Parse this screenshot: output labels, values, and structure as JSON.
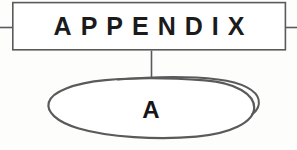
{
  "page": {
    "background_color": "#fdfdfc",
    "ink_color": "#4a4a4a",
    "text_color": "#1b1b1b",
    "width": 297,
    "height": 150
  },
  "header_box": {
    "label": "APPENDIX",
    "border_color": "#555555",
    "fill_color": "#ffffff"
  },
  "rules": {
    "left_rule_label": "left-margin-rule",
    "right_rule_label": "right-margin-rule",
    "connector_label": "vertical-connector"
  },
  "ellipse": {
    "label": "A",
    "stroke_color": "#555555",
    "fill_color": "#ffffff"
  }
}
